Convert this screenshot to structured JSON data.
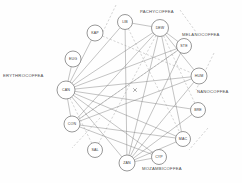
{
  "diagram": {
    "type": "node-link-network",
    "background_color": "#fefefe",
    "node_fill": "#ffffff",
    "node_stroke": "#6b6b6b",
    "edge_color": "#7a7a7a",
    "dashed_edge_color": "#9a9a9a",
    "label_color": "#3a3a3a"
  },
  "nodes": [
    {
      "id": "LIB",
      "label": "LIB",
      "x": 125,
      "y": 22,
      "r": 7.5
    },
    {
      "id": "DEW",
      "label": "DEW",
      "x": 160,
      "y": 28,
      "r": 8.5
    },
    {
      "id": "STE",
      "label": "STE",
      "x": 184,
      "y": 46,
      "r": 7.5
    },
    {
      "id": "KAP",
      "label": "KAP",
      "x": 95,
      "y": 33,
      "r": 8.0
    },
    {
      "id": "EUG",
      "label": "EUG",
      "x": 73,
      "y": 59,
      "r": 8.0
    },
    {
      "id": "HUM",
      "label": "HUM",
      "x": 199,
      "y": 76,
      "r": 8.0
    },
    {
      "id": "CAN",
      "label": "CAN",
      "x": 66,
      "y": 90,
      "r": 9.0
    },
    {
      "id": "BRE",
      "label": "BRE",
      "x": 198,
      "y": 110,
      "r": 7.5
    },
    {
      "id": "CON",
      "label": "CON",
      "x": 72,
      "y": 124,
      "r": 8.0
    },
    {
      "id": "MAC",
      "label": "MAC",
      "x": 183,
      "y": 139,
      "r": 7.5
    },
    {
      "id": "SAL",
      "label": "SAL",
      "x": 95,
      "y": 150,
      "r": 7.5
    },
    {
      "id": "ZAN",
      "label": "ZAN",
      "x": 127,
      "y": 163,
      "r": 8.0
    },
    {
      "id": "CYP",
      "label": "CYP",
      "x": 159,
      "y": 157,
      "r": 7.5
    }
  ],
  "group_labels": [
    {
      "id": "erythrocoffea",
      "text": "ERYTHROCOFFEA",
      "x": 3,
      "y": 77,
      "anchor": "start"
    },
    {
      "id": "pachycoffea",
      "text": "PACHYCOFFEA",
      "x": 140,
      "y": 13,
      "anchor": "start"
    },
    {
      "id": "melanocoffea",
      "text": "MELANOCOFFEA",
      "x": 182,
      "y": 36,
      "anchor": "start"
    },
    {
      "id": "nanocoffea",
      "text": "NANOCOFFEA",
      "x": 197,
      "y": 93,
      "anchor": "start"
    },
    {
      "id": "mozambicoffea",
      "text": "MOZAMBICOFFEA",
      "x": 142,
      "y": 170,
      "anchor": "start"
    }
  ],
  "edges": [
    {
      "from": "CAN",
      "to": "KAP",
      "style": "solid"
    },
    {
      "from": "CAN",
      "to": "EUG",
      "style": "solid"
    },
    {
      "from": "CAN",
      "to": "LIB",
      "style": "solid"
    },
    {
      "from": "CAN",
      "to": "DEW",
      "style": "solid"
    },
    {
      "from": "CAN",
      "to": "STE",
      "style": "solid"
    },
    {
      "from": "CAN",
      "to": "HUM",
      "style": "solid"
    },
    {
      "from": "CAN",
      "to": "BRE",
      "style": "solid"
    },
    {
      "from": "CAN",
      "to": "MAC",
      "style": "solid"
    },
    {
      "from": "CAN",
      "to": "CYP",
      "style": "solid"
    },
    {
      "from": "CAN",
      "to": "ZAN",
      "style": "solid"
    },
    {
      "from": "CAN",
      "to": "CON",
      "style": "solid"
    },
    {
      "from": "CAN",
      "to": "SAL",
      "style": "dashed"
    },
    {
      "from": "DEW",
      "to": "STE",
      "style": "solid"
    },
    {
      "from": "DEW",
      "to": "HUM",
      "style": "solid"
    },
    {
      "from": "DEW",
      "to": "ZAN",
      "style": "solid"
    },
    {
      "from": "DEW",
      "to": "MAC",
      "style": "solid"
    },
    {
      "from": "DEW",
      "to": "CON",
      "style": "solid"
    },
    {
      "from": "DEW",
      "to": "SAL",
      "style": "dashed"
    },
    {
      "from": "LIB",
      "to": "DEW",
      "style": "solid"
    },
    {
      "from": "LIB",
      "to": "ZAN",
      "style": "solid"
    },
    {
      "from": "STE",
      "to": "ZAN",
      "style": "solid"
    },
    {
      "from": "STE",
      "to": "CON",
      "style": "solid"
    },
    {
      "from": "HUM",
      "to": "CON",
      "style": "solid"
    },
    {
      "from": "HUM",
      "to": "ZAN",
      "style": "solid"
    },
    {
      "from": "BRE",
      "to": "ZAN",
      "style": "solid"
    },
    {
      "from": "MAC",
      "to": "ZAN",
      "style": "solid"
    },
    {
      "from": "MAC",
      "to": "CON",
      "style": "solid"
    },
    {
      "from": "ZAN",
      "to": "CYP",
      "style": "solid"
    },
    {
      "from": "CON",
      "to": "CYP",
      "style": "solid"
    },
    {
      "from": "LIB",
      "to": "MAC",
      "style": "dashed"
    },
    {
      "from": "DEW",
      "to": "BRE",
      "style": "dashed"
    },
    {
      "from": "KAP",
      "to": "HUM",
      "style": "dashed"
    },
    {
      "from": "CON",
      "to": "STE",
      "style": "dashed"
    }
  ],
  "free_dashes": [
    {
      "id": "dash-top-left",
      "x1": 116,
      "y1": 5,
      "x2": 99,
      "y2": 40
    },
    {
      "id": "dash-top-right",
      "x1": 180,
      "y1": 10,
      "x2": 196,
      "y2": 32
    },
    {
      "id": "dash-right",
      "x1": 214,
      "y1": 53,
      "x2": 196,
      "y2": 90
    },
    {
      "id": "dash-lower-left",
      "x1": 100,
      "y1": 118,
      "x2": 72,
      "y2": 148
    },
    {
      "id": "dash-right-low",
      "x1": 208,
      "y1": 128,
      "x2": 189,
      "y2": 150
    }
  ],
  "marks": [
    {
      "id": "center-cross",
      "x": 135,
      "y": 90,
      "size": 1.8
    }
  ]
}
